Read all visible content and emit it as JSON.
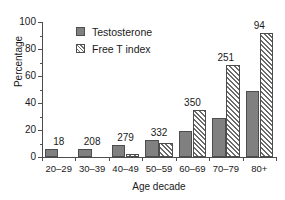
{
  "chart_data": {
    "type": "bar",
    "title": "",
    "xlabel": "Age decade",
    "ylabel": "Percentage",
    "categories": [
      "20–29",
      "30–39",
      "40–49",
      "50–59",
      "60–69",
      "70–79",
      "80+"
    ],
    "series": [
      {
        "name": "Testosterone",
        "values": [
          6,
          6,
          9,
          12.5,
          19,
          29,
          49
        ],
        "style": "solid-gray"
      },
      {
        "name": "Free T index",
        "values": [
          0,
          0,
          2.5,
          10.5,
          35,
          68,
          92
        ],
        "style": "hatched-diagonal"
      }
    ],
    "group_labels": [
      "18",
      "208",
      "279",
      "332",
      "350",
      "251",
      "94"
    ],
    "ylim": [
      0,
      100
    ],
    "yticks": [
      0,
      20,
      40,
      60,
      80,
      100
    ],
    "ytick_labels": [
      "0",
      "20",
      "40",
      "60",
      "80",
      "100"
    ],
    "yminor_ticks": [
      10,
      30,
      50,
      70,
      90
    ],
    "grid": false,
    "legend_position": "top-left-inside"
  },
  "legend": {
    "entries": [
      {
        "label": "Testosterone",
        "swatch": "solid-gray-square"
      },
      {
        "label": "Free T index",
        "swatch": "hatched-square"
      }
    ]
  },
  "colors": {
    "bar_solid": "#808080",
    "bar_hatch_line": "#6b6b6b",
    "bar_border": "#4d4d4d",
    "axis": "#4d4d4d",
    "text": "#1a1a1a",
    "background": "#ffffff"
  }
}
